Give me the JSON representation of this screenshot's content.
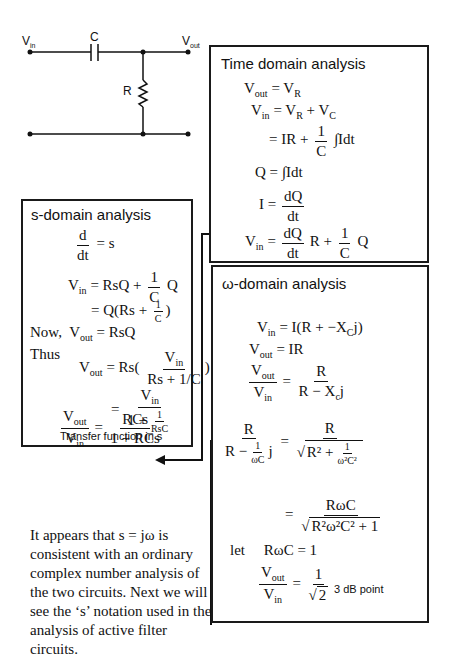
{
  "circuit": {
    "labels": {
      "vin": "V",
      "vin_sub": "in",
      "c": "C",
      "vout": "V",
      "vout_sub": "out",
      "r": "R"
    }
  },
  "time_domain": {
    "title": "Time domain analysis",
    "eq1_lhs": "V",
    "eq1_lhs_sub": "out",
    "eq1_rhs": "= V",
    "eq1_rhs_sub": "R",
    "eq2_lhs": "V",
    "eq2_lhs_sub": "in",
    "eq2_rhs_a": "= V",
    "eq2_rhs_a_sub": "R",
    "eq2_rhs_b": " + V",
    "eq2_rhs_b_sub": "C",
    "eq3_a": "= IR +",
    "eq3_num": "1",
    "eq3_den": "C",
    "eq3_b": "∫Idt",
    "eq4": "Q = ∫Idt",
    "eq5_lhs": "I =",
    "eq5_num": "dQ",
    "eq5_den": "dt",
    "eq6_lhs": "V",
    "eq6_lhs_sub": "in",
    "eq6_eq": "=",
    "eq6_num1": "dQ",
    "eq6_den1": "dt",
    "eq6_mid": "R +",
    "eq6_num2": "1",
    "eq6_den2": "C",
    "eq6_end": "Q"
  },
  "s_domain": {
    "title": "s-domain analysis",
    "eq1_num": "d",
    "eq1_den": "dt",
    "eq1_rhs": "= s",
    "eq2_lhs": "V",
    "eq2_lhs_sub": "in",
    "eq2_rhs": "= RsQ +",
    "eq2_num": "1",
    "eq2_den": "C",
    "eq2_end": "Q",
    "eq3": "= Q(Rs +",
    "eq3_num": "1",
    "eq3_den": "C",
    "eq3_end": ")",
    "eq4_prefix": "Now,",
    "eq4_lhs": "V",
    "eq4_lhs_sub": "out",
    "eq4_rhs": "= RsQ",
    "eq5_prefix": "Thus",
    "eq5_lhs": "V",
    "eq5_lhs_sub": "out",
    "eq5_rhs": "= Rs(",
    "eq5_num": "V",
    "eq5_num_sub": "in",
    "eq5_den": "Rs + 1/C",
    "eq5_end": ")",
    "eq6_eq": "=",
    "eq6_num": "V",
    "eq6_num_sub": "in",
    "eq6_den": "1 +",
    "eq6_den_num": "1",
    "eq6_den_den": "RsC",
    "eq7_lnum": "V",
    "eq7_lnum_sub": "out",
    "eq7_lden": "V",
    "eq7_lden_sub": "in",
    "eq7_eq": "=",
    "eq7_rnum": "RCs",
    "eq7_rden": "1 + RCs",
    "caption": "Transfer function in s"
  },
  "omega_domain": {
    "title": "ω-domain analysis",
    "eq1_lhs": "V",
    "eq1_lhs_sub": "in",
    "eq1_rhs": "= I(R + −X",
    "eq1_rhs_sub": "C",
    "eq1_end": "j)",
    "eq2_lhs": "V",
    "eq2_lhs_sub": "out",
    "eq2_rhs": "= IR",
    "eq3_lnum": "V",
    "eq3_lnum_sub": "out",
    "eq3_lden": "V",
    "eq3_lden_sub": "in",
    "eq3_eq": "=",
    "eq3_rnum": "R",
    "eq3_rden": "R − X",
    "eq3_rden_sub": "c",
    "eq3_rden_end": "j",
    "eq4_lnum": "R",
    "eq4_lden_a": "R −",
    "eq4_lden_num": "1",
    "eq4_lden_den": "ωC",
    "eq4_lden_b": "j",
    "eq4_eq": "=",
    "eq4_rnum": "R",
    "eq4_rden_a": "R² +",
    "eq4_rden_num": "1",
    "eq4_rden_den": "ω²C²",
    "eq5_eq": "=",
    "eq5_num": "RωC",
    "eq5_den": "R²ω²C² + 1",
    "eq6_prefix": "let",
    "eq6": "RωC = 1",
    "eq7_lnum": "V",
    "eq7_lnum_sub": "out",
    "eq7_lden": "V",
    "eq7_lden_sub": "in",
    "eq7_eq": "=",
    "eq7_rnum": "1",
    "eq7_rden": "2",
    "note": "3 dB point"
  },
  "paragraph": {
    "text": "It appears that s = jω is consistent with an ordinary complex number analysis of the two circuits. Next we will see the ‘s’ notation used in the analysis of active filter circuits."
  }
}
